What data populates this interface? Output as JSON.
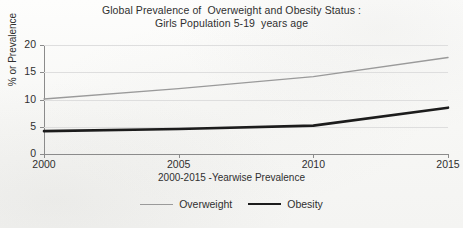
{
  "chart_data": {
    "type": "line",
    "title": "Global Prevalence of  Overweight and Obesity Status :",
    "subtitle": "Girls Population 5-19  years age",
    "xlabel": "2000-2015 -Yearwise Prevalence",
    "ylabel": "% or Prevalence",
    "x": [
      2000,
      2005,
      2010,
      2015
    ],
    "xtick_labels": [
      "2000",
      "2005",
      "2010",
      "2015"
    ],
    "xlim": [
      2000,
      2015
    ],
    "ytick_labels": [
      "0",
      "5",
      "10",
      "15",
      "20"
    ],
    "yticks": [
      0,
      5,
      10,
      15,
      20
    ],
    "ylim": [
      0,
      20
    ],
    "grid": true,
    "legend_position": "bottom-center",
    "series": [
      {
        "name": "Overweight",
        "color": "#9a9a9a",
        "line_width": 1.4,
        "values": [
          10.1,
          12.0,
          14.2,
          17.7
        ]
      },
      {
        "name": "Obesity",
        "color": "#1c1c1c",
        "line_width": 2.6,
        "values": [
          4.2,
          4.6,
          5.2,
          8.5
        ]
      }
    ]
  },
  "legend": {
    "overweight_label": "Overweight",
    "obesity_label": "Obesity"
  },
  "colors": {
    "overweight": "#9a9a9a",
    "obesity": "#1c1c1c",
    "axis": "#8b8b8b",
    "grid": "#dedede",
    "text": "#2f2f2f",
    "background": "#fbfbfa"
  }
}
